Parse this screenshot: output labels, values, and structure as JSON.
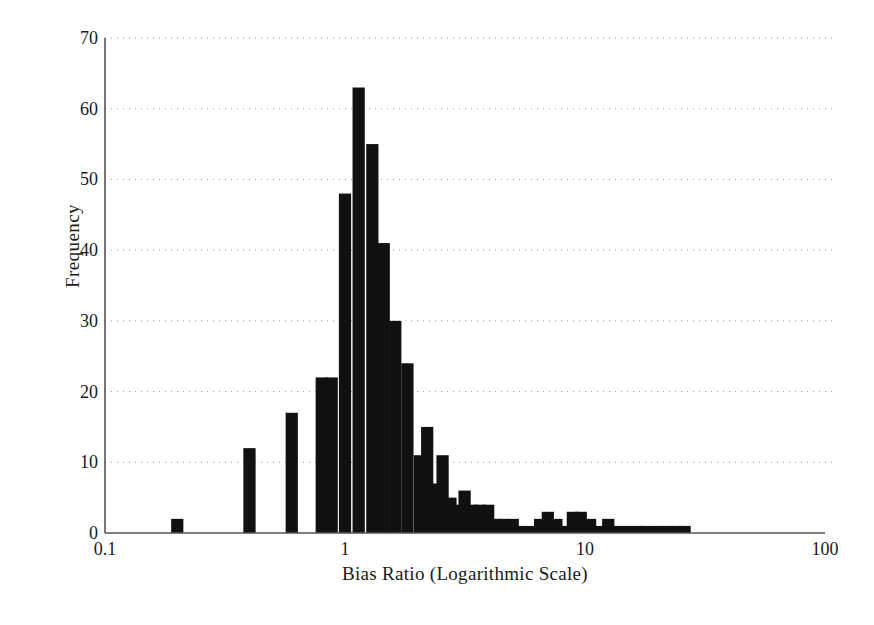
{
  "chart_data": {
    "type": "bar",
    "title": "",
    "subtitle": "",
    "xlabel": "Bias Ratio (Logarithmic Scale)",
    "ylabel": "Frequency",
    "x_scale": "log",
    "xlim": [
      0.1,
      100
    ],
    "ylim": [
      0,
      70
    ],
    "grid": "horizontal-dotted",
    "legend": "none",
    "bar_color": "#111111",
    "axis_color": "#555555",
    "grid_color": "#999999",
    "x_tick_labels": [
      "0.1",
      "1",
      "10",
      "100"
    ],
    "x_tick_values": [
      0.1,
      1,
      10,
      100
    ],
    "y_tick_labels": [
      "0",
      "10",
      "20",
      "30",
      "40",
      "50",
      "60",
      "70"
    ],
    "y_tick_values": [
      0,
      10,
      20,
      30,
      40,
      50,
      60,
      70
    ],
    "bin_edges_note": "logarithmic bins, ~0.03 decades per bin",
    "bars": [
      {
        "x": 0.2,
        "value": 2
      },
      {
        "x": 0.4,
        "value": 12
      },
      {
        "x": 0.6,
        "value": 17
      },
      {
        "x": 0.8,
        "value": 22
      },
      {
        "x": 0.88,
        "value": 22
      },
      {
        "x": 1.0,
        "value": 48
      },
      {
        "x": 1.14,
        "value": 63
      },
      {
        "x": 1.3,
        "value": 55
      },
      {
        "x": 1.45,
        "value": 41
      },
      {
        "x": 1.62,
        "value": 30
      },
      {
        "x": 1.82,
        "value": 24
      },
      {
        "x": 2.05,
        "value": 11
      },
      {
        "x": 2.2,
        "value": 15
      },
      {
        "x": 2.4,
        "value": 7
      },
      {
        "x": 2.55,
        "value": 11
      },
      {
        "x": 2.75,
        "value": 5
      },
      {
        "x": 2.95,
        "value": 4
      },
      {
        "x": 3.15,
        "value": 6
      },
      {
        "x": 3.4,
        "value": 4
      },
      {
        "x": 3.65,
        "value": 4
      },
      {
        "x": 3.95,
        "value": 4
      },
      {
        "x": 4.25,
        "value": 2
      },
      {
        "x": 4.6,
        "value": 2
      },
      {
        "x": 5.0,
        "value": 2
      },
      {
        "x": 5.4,
        "value": 1
      },
      {
        "x": 6.0,
        "value": 1
      },
      {
        "x": 6.5,
        "value": 2
      },
      {
        "x": 7.0,
        "value": 3
      },
      {
        "x": 7.6,
        "value": 2
      },
      {
        "x": 8.2,
        "value": 1
      },
      {
        "x": 8.9,
        "value": 3
      },
      {
        "x": 9.6,
        "value": 3
      },
      {
        "x": 10.5,
        "value": 2
      },
      {
        "x": 11.5,
        "value": 1
      },
      {
        "x": 12.5,
        "value": 2
      },
      {
        "x": 13.5,
        "value": 1
      },
      {
        "x": 15.0,
        "value": 1
      },
      {
        "x": 16.5,
        "value": 1
      },
      {
        "x": 18.0,
        "value": 1
      },
      {
        "x": 20.0,
        "value": 1
      },
      {
        "x": 22.0,
        "value": 1
      },
      {
        "x": 24.0,
        "value": 1
      },
      {
        "x": 26.0,
        "value": 1
      }
    ]
  },
  "axes": {
    "y_label": "Frequency",
    "x_label": "Bias Ratio (Logarithmic Scale)"
  }
}
